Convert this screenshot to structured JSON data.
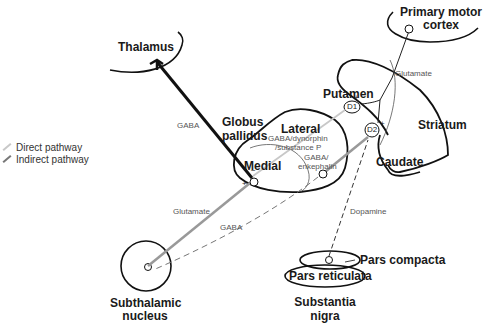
{
  "diagram": {
    "structures": {
      "thalamus": "Thalamus",
      "primary_motor_cortex_line1": "Primary motor",
      "primary_motor_cortex_line2": "cortex",
      "globus_pallidus_line1": "Globus",
      "globus_pallidus_line2": "pallidus",
      "lateral": "Lateral",
      "medial": "Medial",
      "putamen": "Putamen",
      "striatum": "Striatum",
      "caudate": "Caudate",
      "subthalamic_line1": "Subthalamic",
      "subthalamic_line2": "nucleus",
      "pars_compacta": "Pars compacta",
      "pars_reticulata": "Pars reticulata",
      "substantia_line1": "Substantia",
      "substantia_line2": "nigra"
    },
    "neurotransmitters": {
      "gaba_thalamus": "GABA",
      "glutamate_cortex": "Glutamate",
      "gaba_dynorphin_line1": "GABA/dynorphin",
      "gaba_dynorphin_line2": "/substance P",
      "gaba_enkephalin_line1": "GABA/",
      "gaba_enkephalin_line2": "enkephalin",
      "glutamate_stn": "Glutamate",
      "gaba_stn": "GABA",
      "dopamine": "Dopamine"
    },
    "receptors": {
      "d1": "D1",
      "d2": "D2"
    },
    "signs": {
      "d1_plus": "+",
      "d2_plus": "+",
      "medial_minus": "−",
      "medial_plus": "+"
    },
    "legend": {
      "direct": "Direct pathway",
      "indirect": "Indirect pathway"
    },
    "colors": {
      "outline": "#111111",
      "direct_pathway": "#c8c8c8",
      "indirect_pathway": "#8a8a8a",
      "text_small": "#555555"
    }
  }
}
